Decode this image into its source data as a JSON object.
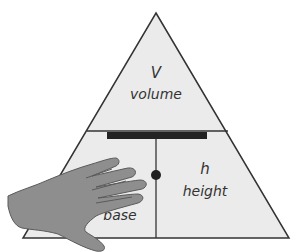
{
  "diagram": {
    "type": "formula-triangle",
    "colors": {
      "fill": "#ebebeb",
      "stroke": "#333333",
      "bar": "#222222",
      "hand_fill": "#8e8e8e",
      "hand_stroke": "#5a5a5a"
    },
    "top": {
      "symbol": "V",
      "word": "volume"
    },
    "bottom_right": {
      "symbol": "h",
      "word": "height"
    },
    "bottom_left": {
      "symbol": "",
      "word_visible": "ase",
      "word_full": "base"
    },
    "separator": "division bar",
    "operator": "multiplication dot",
    "occluder": "hand covering base section"
  }
}
